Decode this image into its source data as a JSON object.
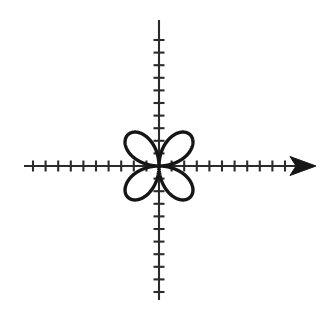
{
  "figure": {
    "title": "",
    "background_color": "#ffffff",
    "width": 336,
    "height": 320
  },
  "chart_data": {
    "type": "line",
    "title": "",
    "subtitle": "",
    "xlabel": "",
    "ylabel": "",
    "curve_name": "four-petal-rose",
    "polar_equation": "r = a*sin(2*theta)",
    "petal_count": 4,
    "petal_orientation_degrees": [
      45,
      135,
      225,
      315
    ],
    "amplitude_units": 3.5,
    "grid": false,
    "legend": false,
    "legend_position": "none",
    "xlim": [
      -10.2,
      11.2
    ],
    "ylim": [
      -11.7,
      11.7
    ],
    "origin_px": {
      "x": 159,
      "y": 166
    },
    "unit_px": 12.6,
    "axes": {
      "x_axis": {
        "name": "x-axis",
        "arrow_start": false,
        "arrow_end": true,
        "start_px": 24,
        "end_px": 316,
        "tick_values": [
          -10,
          -9,
          -8,
          -7,
          -6,
          -5,
          -4,
          -3,
          -2,
          -1,
          1,
          2,
          3,
          4,
          5,
          6,
          7,
          8,
          9,
          10
        ],
        "tick_length_px": 11
      },
      "y_axis": {
        "name": "y-axis",
        "arrow_start": false,
        "arrow_end": false,
        "start_px": 20,
        "end_px": 300,
        "tick_values": [
          -10,
          -9,
          -8,
          -7,
          -6,
          -5,
          -4,
          -3,
          -2,
          -1,
          1,
          2,
          3,
          4,
          5,
          6,
          7,
          8,
          9,
          10
        ],
        "tick_length_px": 11
      }
    },
    "series": [
      {
        "name": "rose-curve",
        "color": "#161616",
        "line_width_px": 3.4,
        "closed": true,
        "points_polar": [
          {
            "theta_deg": 0,
            "r": 0.0
          },
          {
            "theta_deg": 15,
            "r": 1.75
          },
          {
            "theta_deg": 30,
            "r": 3.03
          },
          {
            "theta_deg": 45,
            "r": 3.5
          },
          {
            "theta_deg": 60,
            "r": 3.03
          },
          {
            "theta_deg": 75,
            "r": 1.75
          },
          {
            "theta_deg": 90,
            "r": 0.0
          },
          {
            "theta_deg": 105,
            "r": -1.75
          },
          {
            "theta_deg": 120,
            "r": -3.03
          },
          {
            "theta_deg": 135,
            "r": -3.5
          },
          {
            "theta_deg": 150,
            "r": -3.03
          },
          {
            "theta_deg": 165,
            "r": -1.75
          },
          {
            "theta_deg": 180,
            "r": 0.0
          },
          {
            "theta_deg": 195,
            "r": 1.75
          },
          {
            "theta_deg": 210,
            "r": 3.03
          },
          {
            "theta_deg": 225,
            "r": 3.5
          },
          {
            "theta_deg": 240,
            "r": 3.03
          },
          {
            "theta_deg": 255,
            "r": 1.75
          },
          {
            "theta_deg": 270,
            "r": 0.0
          },
          {
            "theta_deg": 285,
            "r": -1.75
          },
          {
            "theta_deg": 300,
            "r": -3.03
          },
          {
            "theta_deg": 315,
            "r": -3.5
          },
          {
            "theta_deg": 330,
            "r": -3.03
          },
          {
            "theta_deg": 345,
            "r": -1.75
          },
          {
            "theta_deg": 360,
            "r": 0.0
          }
        ],
        "petal_tips_xy": [
          {
            "x": 2.48,
            "y": 2.48
          },
          {
            "x": -2.48,
            "y": 2.48
          },
          {
            "x": -2.48,
            "y": -2.48
          },
          {
            "x": 2.48,
            "y": -2.48
          }
        ]
      }
    ],
    "annotations": []
  },
  "colors": {
    "curve": "#161616",
    "axis": "#2b2b2b",
    "tick": "#2b2b2b",
    "arrow": "#161616",
    "background": "#ffffff"
  }
}
